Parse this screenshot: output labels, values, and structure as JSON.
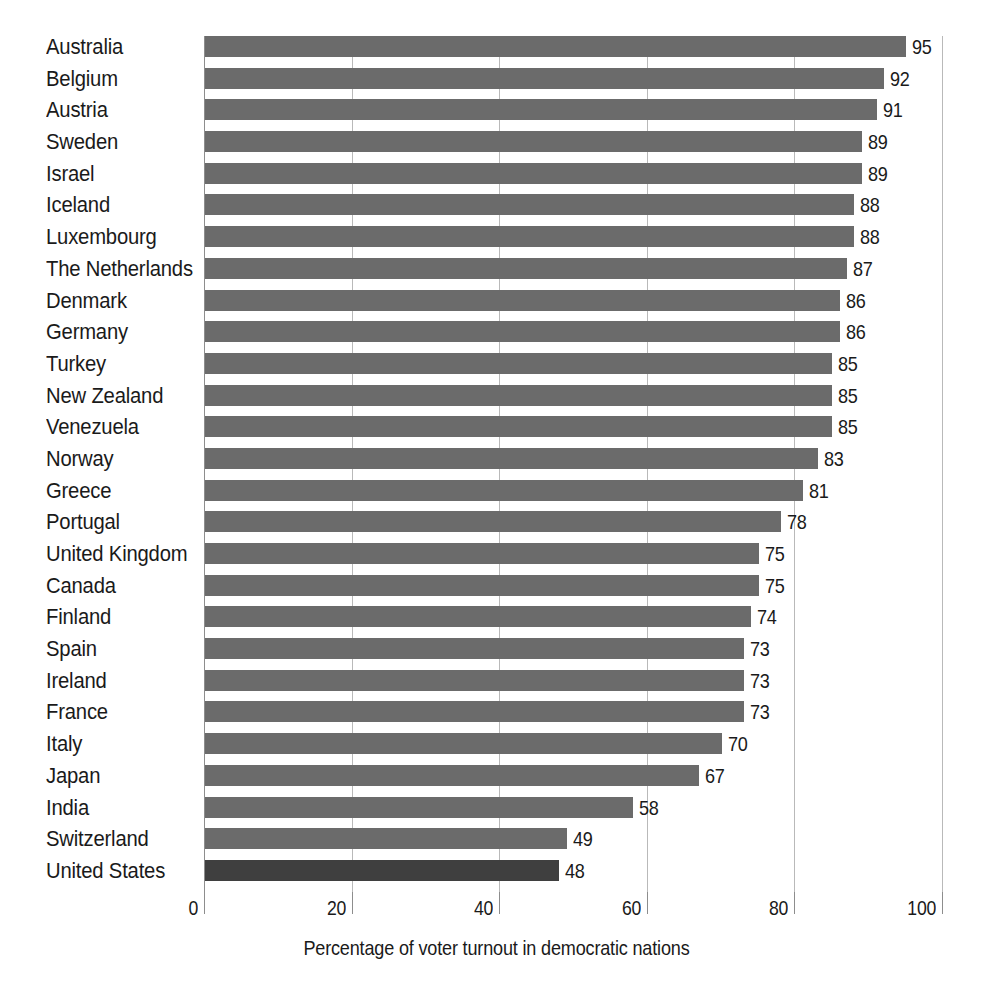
{
  "chart_data": {
    "type": "bar",
    "orientation": "horizontal",
    "title": "",
    "xlabel": "Percentage of voter turnout in democratic nations",
    "ylabel": "",
    "xlim": [
      0,
      100
    ],
    "xticks": [
      0,
      20,
      40,
      60,
      80,
      100
    ],
    "xtick_labels": [
      "0",
      "20",
      "40",
      "60",
      "80",
      "100"
    ],
    "grid": true,
    "legend": false,
    "value_labels": true,
    "categories": [
      "Australia",
      "Belgium",
      "Austria",
      "Sweden",
      "Israel",
      "Iceland",
      "Luxembourg",
      "The Netherlands",
      "Denmark",
      "Germany",
      "Turkey",
      "New Zealand",
      "Venezuela",
      "Norway",
      "Greece",
      "Portugal",
      "United Kingdom",
      "Canada",
      "Finland",
      "Spain",
      "Ireland",
      "France",
      "Italy",
      "Japan",
      "India",
      "Switzerland",
      "United States"
    ],
    "values": [
      95,
      92,
      91,
      89,
      89,
      88,
      88,
      87,
      86,
      86,
      85,
      85,
      85,
      83,
      81,
      78,
      75,
      75,
      74,
      73,
      73,
      73,
      70,
      67,
      58,
      49,
      48
    ],
    "highlighted_category": "United States",
    "colors": {
      "bar": "#6b6b6b",
      "bar_highlight": "#3f3f3f",
      "gridline": "#b9b9b9",
      "axis": "#8d8d8d",
      "text": "#1a1a1a",
      "background": "#ffffff"
    }
  }
}
